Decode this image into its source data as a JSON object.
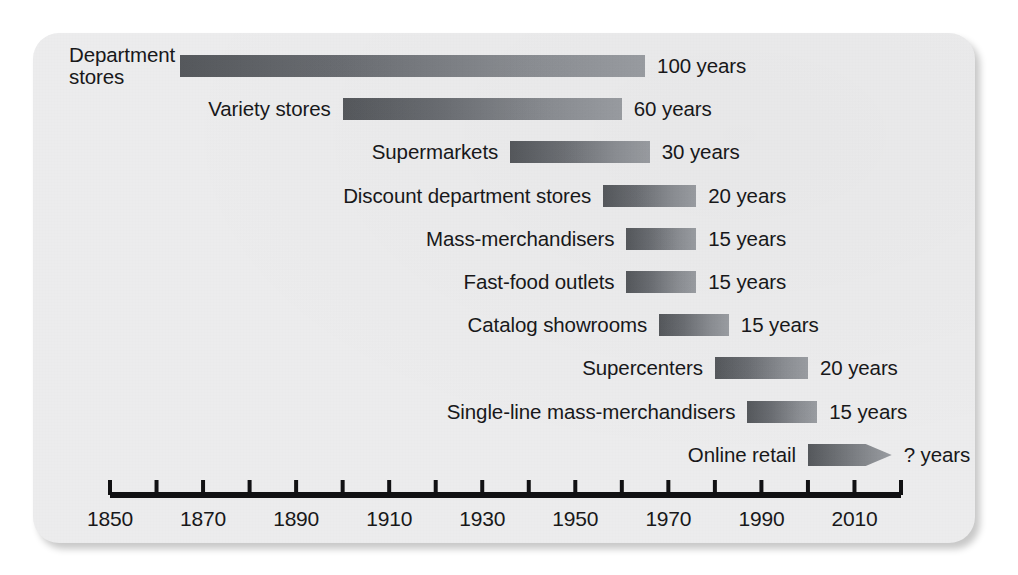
{
  "chart_data": {
    "type": "bar",
    "orientation": "horizontal",
    "title": "",
    "subtitle": "",
    "xlabel": "",
    "ylabel": "",
    "xlim": [
      1850,
      2020
    ],
    "x_tick_step": 10,
    "x_label_step": 20,
    "grid": false,
    "legend": false,
    "value_suffix": "years",
    "x_tick_labels": [
      "1850",
      "1870",
      "1890",
      "1910",
      "1930",
      "1950",
      "1970",
      "1990",
      "2010"
    ],
    "x_tick_label_values": [
      1850,
      1870,
      1890,
      1910,
      1930,
      1950,
      1970,
      1990,
      2010
    ],
    "x_ticks": [
      1850,
      1860,
      1870,
      1880,
      1890,
      1900,
      1910,
      1920,
      1930,
      1940,
      1950,
      1960,
      1970,
      1980,
      1990,
      2000,
      2010,
      2020
    ],
    "categories": [
      "Department stores",
      "Variety stores",
      "Supermarkets",
      "Discount department stores",
      "Mass-merchandisers",
      "Fast-food outlets",
      "Catalog showrooms",
      "Supercenters",
      "Single-line mass-merchandisers",
      "Online retail"
    ],
    "values": [
      100,
      60,
      30,
      20,
      15,
      15,
      15,
      20,
      15,
      null
    ],
    "bars": [
      {
        "label": "Department stores",
        "label_lines": "Department\nstores",
        "two_line": true,
        "start_year": 1865,
        "end_year": 1965,
        "duration": 100,
        "value_label": "100 years",
        "open_ended": false
      },
      {
        "label": "Variety stores",
        "label_lines": "Variety stores",
        "two_line": false,
        "start_year": 1900,
        "end_year": 1960,
        "duration": 60,
        "value_label": "60 years",
        "open_ended": false
      },
      {
        "label": "Supermarkets",
        "label_lines": "Supermarkets",
        "two_line": false,
        "start_year": 1936,
        "end_year": 1966,
        "duration": 30,
        "value_label": "30 years",
        "open_ended": false
      },
      {
        "label": "Discount department stores",
        "label_lines": "Discount department stores",
        "two_line": false,
        "start_year": 1956,
        "end_year": 1976,
        "duration": 20,
        "value_label": "20 years",
        "open_ended": false
      },
      {
        "label": "Mass-merchandisers",
        "label_lines": "Mass-merchandisers",
        "two_line": false,
        "start_year": 1961,
        "end_year": 1976,
        "duration": 15,
        "value_label": "15 years",
        "open_ended": false
      },
      {
        "label": "Fast-food outlets",
        "label_lines": "Fast-food outlets",
        "two_line": false,
        "start_year": 1961,
        "end_year": 1976,
        "duration": 15,
        "value_label": "15 years",
        "open_ended": false
      },
      {
        "label": "Catalog showrooms",
        "label_lines": "Catalog showrooms",
        "two_line": false,
        "start_year": 1968,
        "end_year": 1983,
        "duration": 15,
        "value_label": "15 years",
        "open_ended": false
      },
      {
        "label": "Supercenters",
        "label_lines": "Supercenters",
        "two_line": false,
        "start_year": 1980,
        "end_year": 2000,
        "duration": 20,
        "value_label": "20 years",
        "open_ended": false
      },
      {
        "label": "Single-line mass-merchandisers",
        "label_lines": "Single-line mass-merchandisers",
        "two_line": false,
        "start_year": 1987,
        "end_year": 2002,
        "duration": 15,
        "value_label": "15 years",
        "open_ended": false
      },
      {
        "label": "Online retail",
        "label_lines": "Online retail",
        "two_line": false,
        "start_year": 2000,
        "end_year": 2018,
        "duration": null,
        "value_label": "? years",
        "open_ended": true
      }
    ],
    "colors": {
      "bar_gradient_dark": "#55585c",
      "bar_gradient_light": "#9a9da2",
      "axis": "#111113",
      "text": "#18181a",
      "card_background": "#ececed",
      "page_background": "#ffffff"
    }
  }
}
